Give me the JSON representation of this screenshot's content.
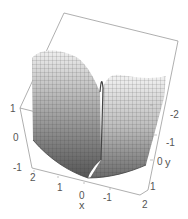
{
  "chart_data": {
    "type": "surface3d",
    "title": "",
    "xlabel": "x",
    "ylabel": "y",
    "zlabel": "",
    "x_ticks": [
      "2",
      "1",
      "0",
      "-1",
      "2"
    ],
    "y_ticks": [
      "-2",
      "-1",
      "0",
      "1",
      "2"
    ],
    "z_ticks": [
      "1",
      "0",
      "-1"
    ],
    "xlim": [
      -2,
      2
    ],
    "ylim": [
      -2,
      2
    ],
    "zlim": [
      -1,
      1
    ],
    "grid": false,
    "legend": "none",
    "surface_description": "Grey meshed surface forming a valley along x≈0; high plateau near z≈1 on both sides, dropping to z≈-1 at the front corner",
    "colors": {
      "surface_light": "#e8e8e8",
      "surface_dark": "#5a5a5a",
      "mesh": "#333333",
      "box": "#9a9a9a"
    }
  },
  "labels": {
    "z": [
      {
        "text": "1",
        "x": 10,
        "y": 104
      },
      {
        "text": "0",
        "x": 13,
        "y": 133
      },
      {
        "text": "-1",
        "x": 13,
        "y": 163
      }
    ],
    "x": [
      {
        "text": "2",
        "x": 30,
        "y": 173
      },
      {
        "text": "1",
        "x": 57,
        "y": 183
      },
      {
        "text": "0",
        "x": 79,
        "y": 191
      },
      {
        "text": "-1",
        "x": 103,
        "y": 193
      },
      {
        "text": "2",
        "x": 142,
        "y": 200
      }
    ],
    "y": [
      {
        "text": "-2",
        "x": 170,
        "y": 110
      },
      {
        "text": "-1",
        "x": 166,
        "y": 138
      },
      {
        "text": "0",
        "x": 157,
        "y": 157
      },
      {
        "text": "1",
        "x": 150,
        "y": 182
      }
    ],
    "x_axis_name": {
      "text": "x",
      "x": 79,
      "y": 200
    },
    "y_axis_name": {
      "text": "y",
      "x": 165,
      "y": 157
    }
  }
}
